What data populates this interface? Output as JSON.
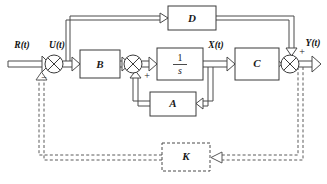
{
  "diagram": {
    "type": "control-block-diagram",
    "background_color": "#ffffff",
    "line_color": "#4a4a4a",
    "blocks": [
      {
        "id": "B",
        "label": "B",
        "style": "solid",
        "x": 80,
        "y": 50,
        "w": 40,
        "h": 28
      },
      {
        "id": "D",
        "label": "D",
        "style": "solid",
        "x": 168,
        "y": 8,
        "w": 48,
        "h": 24
      },
      {
        "id": "INT",
        "label": "1/s",
        "numerator": "1",
        "denominator": "s",
        "style": "solid",
        "x": 157,
        "y": 48,
        "w": 46,
        "h": 30
      },
      {
        "id": "C",
        "label": "C",
        "style": "solid",
        "x": 235,
        "y": 48,
        "w": 44,
        "h": 30
      },
      {
        "id": "A",
        "label": "A",
        "style": "solid",
        "x": 157,
        "y": 94,
        "w": 46,
        "h": 24
      },
      {
        "id": "K",
        "label": "K",
        "style": "dashed",
        "x": 162,
        "y": 142,
        "w": 48,
        "h": 28
      }
    ],
    "summing_junctions": [
      {
        "id": "sum1",
        "cx": 54,
        "cy": 64,
        "r": 9,
        "signs": [
          {
            "text": "−",
            "x": 44,
            "y": 79
          }
        ]
      },
      {
        "id": "sum2",
        "cx": 133,
        "cy": 64,
        "r": 9,
        "signs": [
          {
            "text": "+",
            "x": 146,
            "y": 76
          }
        ]
      },
      {
        "id": "sum3",
        "cx": 290,
        "cy": 64,
        "r": 9,
        "signs": [
          {
            "text": "+",
            "x": 301,
            "y": 53
          }
        ]
      }
    ],
    "signal_labels": [
      {
        "id": "R",
        "text": "R(t)",
        "x": 22,
        "y": 46
      },
      {
        "id": "U",
        "text": "U(t)",
        "x": 56,
        "y": 46
      },
      {
        "id": "X",
        "text": "X(t)",
        "x": 216,
        "y": 46
      },
      {
        "id": "Y",
        "text": "Y(t)",
        "x": 313,
        "y": 44
      }
    ],
    "connections": [
      {
        "from": "R-input",
        "to": "sum1",
        "style": "solid"
      },
      {
        "from": "sum1",
        "to": "B",
        "style": "solid",
        "label": "U(t)"
      },
      {
        "from": "U-branch",
        "to": "D",
        "style": "solid"
      },
      {
        "from": "B",
        "to": "sum2",
        "style": "solid"
      },
      {
        "from": "sum2",
        "to": "INT",
        "style": "solid"
      },
      {
        "from": "INT",
        "to": "C",
        "style": "solid",
        "label": "X(t)"
      },
      {
        "from": "X-branch",
        "to": "A",
        "style": "solid"
      },
      {
        "from": "A",
        "to": "sum2",
        "style": "solid"
      },
      {
        "from": "C",
        "to": "sum3",
        "style": "solid"
      },
      {
        "from": "D",
        "to": "sum3",
        "style": "solid"
      },
      {
        "from": "sum3",
        "to": "Y-output",
        "style": "solid",
        "label": "Y(t)"
      },
      {
        "from": "Y-branch",
        "to": "K",
        "style": "dashed"
      },
      {
        "from": "K",
        "to": "sum1",
        "style": "dashed"
      }
    ]
  }
}
